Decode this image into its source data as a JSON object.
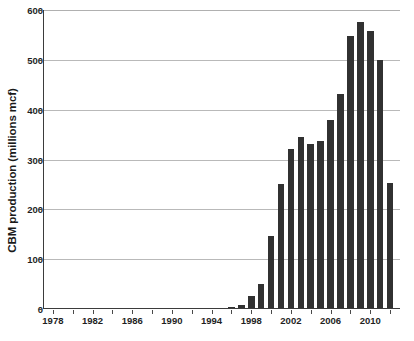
{
  "chart_data": {
    "type": "bar",
    "title": "",
    "xlabel": "",
    "ylabel": "CBM production (millions mcf)",
    "ylim": [
      0,
      600
    ],
    "xlim": [
      1977,
      2013
    ],
    "grid": true,
    "legend": null,
    "bar_color": "#313131",
    "gridline_color": "#b9b9b9",
    "axis_color": "#3b3b3b",
    "ytick_labels": [
      "0",
      "100",
      "200",
      "300",
      "400",
      "500",
      "600"
    ],
    "ytick_values": [
      0,
      100,
      200,
      300,
      400,
      500,
      600
    ],
    "xtick_labels": [
      "1978",
      "1982",
      "1986",
      "1990",
      "1994",
      "1998",
      "2002",
      "2006",
      "2010"
    ],
    "xtick_values": [
      1978,
      1982,
      1986,
      1990,
      1994,
      1998,
      2002,
      2006,
      2010
    ],
    "xtick_minor_values": [
      1980,
      1984,
      1988,
      1992,
      1996,
      2000,
      2004,
      2008,
      2012
    ],
    "categories": [
      1978,
      1979,
      1980,
      1981,
      1982,
      1983,
      1984,
      1985,
      1986,
      1987,
      1988,
      1989,
      1990,
      1991,
      1992,
      1993,
      1994,
      1995,
      1996,
      1997,
      1998,
      1999,
      2000,
      2001,
      2002,
      2003,
      2004,
      2005,
      2006,
      2007,
      2008,
      2009,
      2010,
      2011,
      2012
    ],
    "values": [
      0,
      0,
      0,
      0,
      0,
      0,
      0,
      0,
      0,
      0,
      0,
      0,
      0,
      0,
      0,
      0,
      0,
      3,
      4,
      9,
      27,
      51,
      147,
      251,
      322,
      345,
      331,
      337,
      379,
      432,
      547,
      575,
      557,
      500,
      253
    ]
  }
}
